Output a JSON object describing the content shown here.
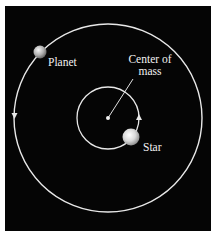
{
  "diagram": {
    "labels": {
      "planet": "Planet",
      "center_line1": "Center of",
      "center_line2": "mass",
      "star": "Star"
    },
    "colors": {
      "background": "#050505",
      "frame": "#ffffff",
      "orbit": "#e8e8e8",
      "text": "#f2f2f2"
    },
    "geometry": {
      "center_of_mass": [
        108,
        118
      ],
      "outer_orbit_radius": 94,
      "inner_orbit_radius": 31,
      "planet_position": [
        40,
        52
      ],
      "star_position": [
        131,
        137
      ]
    }
  }
}
